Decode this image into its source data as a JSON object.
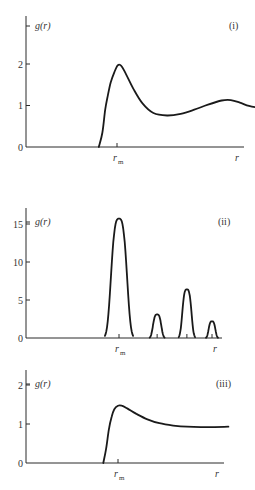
{
  "chart_data": [
    {
      "type": "line",
      "panel_label": "(i)",
      "ylabel": "g(r)",
      "xlabel": "r",
      "x_tick_labels": [
        {
          "x": 1.0,
          "label": "r",
          "sub": "m"
        }
      ],
      "ylim": [
        0,
        2.5
      ],
      "xlim": [
        0,
        3.0
      ],
      "y_ticks": [
        0,
        1,
        2
      ],
      "y_tick_labels": [
        "0",
        "1",
        "2"
      ],
      "grid": false,
      "series": [
        {
          "name": "g(r)",
          "x": [
            0.8,
            0.84,
            0.87,
            0.9,
            0.93,
            0.97,
            1.01,
            1.05,
            1.1,
            1.18,
            1.28,
            1.4,
            1.55,
            1.7,
            1.85,
            2.0,
            2.15,
            2.25,
            2.35,
            2.45,
            2.55,
            2.65,
            2.75
          ],
          "y": [
            0.0,
            0.35,
            0.9,
            1.25,
            1.55,
            1.8,
            1.97,
            1.95,
            1.75,
            1.4,
            1.05,
            0.82,
            0.76,
            0.8,
            0.9,
            1.02,
            1.12,
            1.13,
            1.07,
            0.99,
            0.95,
            0.94,
            0.95
          ]
        }
      ]
    },
    {
      "type": "line",
      "panel_label": "(ii)",
      "ylabel": "g(r)",
      "xlabel": "r",
      "x_tick_labels": [
        {
          "x": 1.0,
          "label": "r",
          "sub": "m"
        }
      ],
      "extra_x_ticks": [
        1.41,
        1.73,
        2.0
      ],
      "ylim": [
        0,
        17
      ],
      "xlim": [
        0,
        2.35
      ],
      "y_ticks": [
        0,
        5,
        10,
        15
      ],
      "y_tick_labels": [
        "0",
        "5",
        "10",
        "15"
      ],
      "grid": false,
      "peaks": [
        {
          "center": 1.0,
          "height": 15.7,
          "half_width": 0.095
        },
        {
          "center": 1.41,
          "height": 3.1,
          "half_width": 0.05
        },
        {
          "center": 1.73,
          "height": 6.4,
          "half_width": 0.055
        },
        {
          "center": 2.0,
          "height": 2.2,
          "half_width": 0.04
        }
      ]
    },
    {
      "type": "line",
      "panel_label": "(iii)",
      "ylabel": "g(r)",
      "xlabel": "r",
      "x_tick_labels": [
        {
          "x": 1.0,
          "label": "r",
          "sub": "m"
        }
      ],
      "ylim": [
        0,
        2.4
      ],
      "xlim": [
        0,
        2.3
      ],
      "y_ticks": [
        0,
        1,
        2
      ],
      "y_tick_labels": [
        "0",
        "1",
        "2"
      ],
      "grid": false,
      "series": [
        {
          "name": "g(r)",
          "x": [
            0.84,
            0.87,
            0.9,
            0.93,
            0.96,
            1.0,
            1.04,
            1.1,
            1.2,
            1.32,
            1.45,
            1.6,
            1.75,
            1.9,
            2.05,
            2.2
          ],
          "y": [
            0.0,
            0.35,
            0.85,
            1.18,
            1.38,
            1.47,
            1.47,
            1.4,
            1.26,
            1.12,
            1.02,
            0.96,
            0.93,
            0.92,
            0.92,
            0.93
          ]
        }
      ]
    }
  ]
}
